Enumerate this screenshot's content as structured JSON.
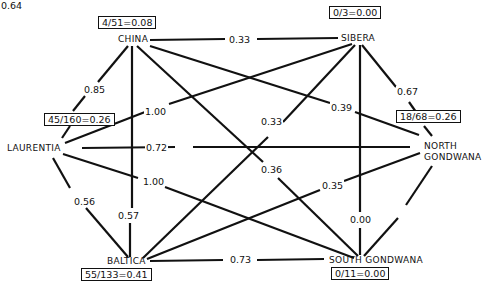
{
  "diagram": {
    "nodes": [
      {
        "id": "china",
        "label": "CHINA",
        "stat": "4/51=0.08"
      },
      {
        "id": "sibera",
        "label": "SIBERA",
        "stat": "0/3=0.00"
      },
      {
        "id": "laurentia",
        "label": "LAURENTIA",
        "stat": "45/160=0.26"
      },
      {
        "id": "north_gondwana",
        "label_line1": "NORTH",
        "label_line2": "GONDWANA",
        "stat": "18/68=0.26"
      },
      {
        "id": "baltica",
        "label": "BALTICA",
        "stat": "55/133=0.41"
      },
      {
        "id": "south_gondwana",
        "label": "SOUTH GONDWANA",
        "stat": "0/11=0.00"
      }
    ],
    "edges": [
      {
        "from": "china",
        "to": "sibera",
        "value": "0.33"
      },
      {
        "from": "china",
        "to": "laurentia",
        "value": "0.85"
      },
      {
        "from": "china",
        "to": "baltica",
        "value": "0.57"
      },
      {
        "from": "china",
        "to": "north_gondwana",
        "value": "0.39"
      },
      {
        "from": "china",
        "to": "south_gondwana",
        "value": "0.36"
      },
      {
        "from": "sibera",
        "to": "laurentia",
        "value": "1.00"
      },
      {
        "from": "sibera",
        "to": "baltica",
        "value": "0.33"
      },
      {
        "from": "sibera",
        "to": "north_gondwana",
        "value": "0.67"
      },
      {
        "from": "sibera",
        "to": "south_gondwana",
        "value": "0.00"
      },
      {
        "from": "laurentia",
        "to": "north_gondwana",
        "value": "0.72"
      },
      {
        "from": "laurentia",
        "to": "south_gondwana",
        "value": "1.00"
      },
      {
        "from": "laurentia",
        "to": "baltica",
        "value": "0.56"
      },
      {
        "from": "baltica",
        "to": "north_gondwana",
        "value": "0.35"
      },
      {
        "from": "baltica",
        "to": "south_gondwana",
        "value": "0.73"
      },
      {
        "from": "north_gondwana",
        "to": "south_gondwana",
        "value": "0.64"
      }
    ]
  }
}
